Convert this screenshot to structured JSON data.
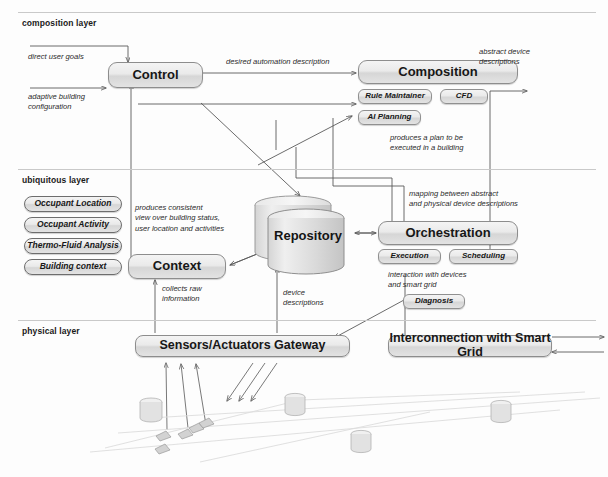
{
  "diagram": {
    "layers": [
      {
        "id": "composition",
        "label": "composition layer"
      },
      {
        "id": "ubiquitous",
        "label": "ubiquitous layer"
      },
      {
        "id": "physical",
        "label": "physical layer"
      }
    ],
    "boxes": {
      "control": "Control",
      "composition": "Composition",
      "rule_maintainer": "Rule Maintainer",
      "cfd": "CFD",
      "ai_planning": "AI Planning",
      "context": "Context",
      "orchestration": "Orchestration",
      "execution": "Execution",
      "scheduling": "Scheduling",
      "diagnosis": "Diagnosis",
      "sensors_gateway": "Sensors/Actuators Gateway",
      "smart_grid": "Interconnection with Smart Grid",
      "repository": "Repository"
    },
    "ubiquitous_modules": [
      "Occupant Location",
      "Occupant Activity",
      "Thermo-Fluid Analysis",
      "Building context"
    ],
    "annotations": {
      "direct_user_goals": "direct user goals",
      "adaptive_building_configuration": "adaptive building\nconfiguration",
      "desired_automation_description": "desired automation description",
      "abstract_device_descriptions": "abstract device\ndescriptions",
      "produces_a_plan": "produces a plan to be\nexecuted in a building",
      "mapping_between": "mapping between abstract\nand physical device descriptions",
      "produces_consistent_view": "produces consistent\nview over building status,\nuser location and activities",
      "interaction_with_devices": "interaction with devices\nand smart grid",
      "collects_raw_information": "collects raw\ninformation",
      "device_descriptions": "device\ndescriptions"
    },
    "colors": {
      "box_border": "#8d8d8d",
      "box_fill_top": "#f4f4f4",
      "box_fill_bottom": "#e3e3e3",
      "arrow": "#5a5a5a",
      "rule": "#c9c9c9",
      "text": "#1a1a1a"
    }
  }
}
